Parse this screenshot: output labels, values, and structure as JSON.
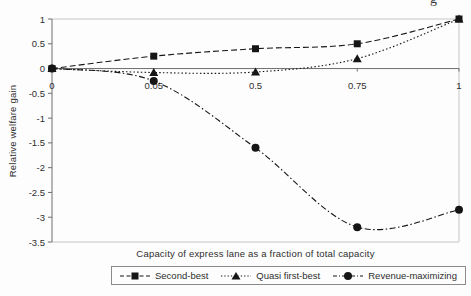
{
  "page": {
    "cropped_text_fragment": "g"
  },
  "chart_data": {
    "type": "line",
    "title": "",
    "xlabel": "Capacity of express lane as a fraction of total capacity",
    "ylabel": "Relative welfare gain",
    "categories": [
      "0",
      "0.05",
      "0.5",
      "0.75",
      "1"
    ],
    "x_axis_type": "categorical-equal-spacing",
    "y_ticks": [
      "1",
      "0.5",
      "0",
      "-0.5",
      "-1",
      "-1.5",
      "-2",
      "-2.5",
      "-3",
      "-3.5"
    ],
    "ylim": [
      -3.5,
      1
    ],
    "grid": "off",
    "legend_position": "bottom-center",
    "series": [
      {
        "name": "Second-best",
        "marker": "square",
        "line_style": "dashed",
        "values": [
          0,
          0.25,
          0.4,
          0.5,
          1
        ]
      },
      {
        "name": "Quasi first-best",
        "marker": "triangle",
        "line_style": "dotted",
        "values": [
          0,
          -0.08,
          -0.07,
          0.2,
          1
        ]
      },
      {
        "name": "Revenue-maximizing",
        "marker": "circle",
        "line_style": "dash-dot",
        "values": [
          0,
          -0.25,
          -1.6,
          -3.2,
          -2.85
        ]
      }
    ],
    "colors": {
      "series": "#151515",
      "axis": "#6e6e6e",
      "plot_border": "#c6c6c6",
      "text": "#2e2e2e",
      "background": "#fdfdfd"
    }
  }
}
